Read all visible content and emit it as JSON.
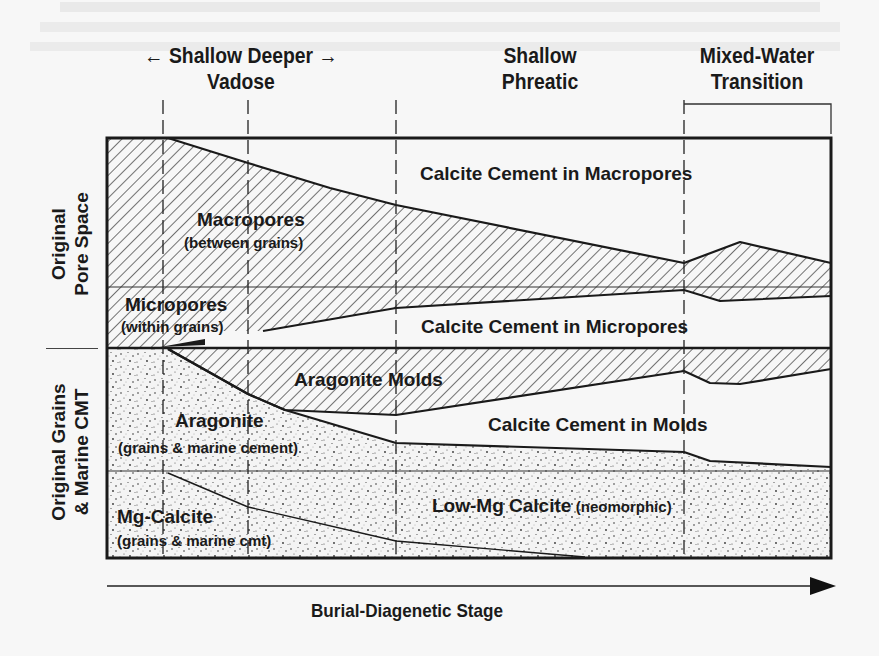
{
  "diagram": {
    "title_axis": "Burial-Diagenetic Stage",
    "zones": [
      {
        "line1": "← Shallow Deeper →",
        "line2": "Vadose",
        "x": 106,
        "w": 270
      },
      {
        "line1": "Shallow",
        "line2": "Phreatic",
        "x": 460,
        "w": 160
      },
      {
        "line1": "Mixed-Water",
        "line2": "Transition",
        "x": 672,
        "w": 170
      }
    ],
    "side_labels": {
      "pore_space": {
        "line1": "Original",
        "line2": "Pore Space"
      },
      "grains": {
        "line1": "Original Grains",
        "line2": "& Marine CMT"
      }
    },
    "regions": {
      "macropores": {
        "title": "Macropores",
        "sub": "(between grains)"
      },
      "micropores": {
        "title": "Micropores",
        "sub": "(within grains)"
      },
      "cc_macropores": {
        "title": "Calcite Cement in Macropores"
      },
      "cc_micropores": {
        "title": "Calcite Cement in Micropores"
      },
      "aragonite_molds": {
        "title": "Aragonite Molds"
      },
      "cc_molds": {
        "title": "Calcite Cement in Molds"
      },
      "aragonite": {
        "title": "Aragonite",
        "sub": "(grains & marine cement)"
      },
      "mg_calcite": {
        "title": "Mg-Calcite",
        "sub": "(grains & marine cmt)"
      },
      "low_mg_calcite": {
        "title": "Low-Mg Calcite",
        "sub": "(neomorphic)"
      }
    },
    "colors": {
      "ink": "#1a1a1a",
      "paper": "#f7f7f7",
      "hatch": "#2a2a2a",
      "stipple": "#3a3a3a"
    },
    "frame": {
      "x0": 107,
      "y0": 138,
      "x1": 831,
      "y1": 558
    },
    "stage_boundaries_x": [
      163,
      248,
      396,
      684
    ],
    "stage_boundary_tops": [
      100,
      100,
      100,
      100
    ],
    "transition_bracket": {
      "x0": 684,
      "x1": 831,
      "y": 104
    },
    "divider_lines_y": {
      "pore_mid": 287,
      "pore_grain": 348,
      "grain_mid": 471
    },
    "boundaries": {
      "macro_top": [
        [
          107,
          138
        ],
        [
          168,
          138
        ],
        [
          248,
          163
        ],
        [
          330,
          188
        ],
        [
          396,
          205
        ],
        [
          684,
          263
        ],
        [
          740,
          242
        ],
        [
          831,
          263
        ]
      ],
      "micro_bottom": [
        [
          263,
          331
        ],
        [
          396,
          308
        ],
        [
          684,
          290
        ],
        [
          720,
          301
        ],
        [
          831,
          296
        ]
      ],
      "molds_bottom": [
        [
          168,
          349
        ],
        [
          248,
          394
        ],
        [
          285,
          410
        ],
        [
          396,
          415
        ],
        [
          684,
          371
        ],
        [
          710,
          383
        ],
        [
          740,
          384
        ],
        [
          831,
          369
        ]
      ],
      "aragonite_top": [
        [
          168,
          349
        ],
        [
          248,
          394
        ],
        [
          285,
          410
        ],
        [
          396,
          443
        ],
        [
          684,
          452
        ],
        [
          710,
          461
        ],
        [
          831,
          467
        ]
      ],
      "mgcalcite_line": [
        [
          168,
          473
        ],
        [
          248,
          507
        ],
        [
          396,
          541
        ],
        [
          585,
          557
        ]
      ]
    },
    "axis_arrow": {
      "x0": 107,
      "x1": 836,
      "y": 586
    }
  }
}
